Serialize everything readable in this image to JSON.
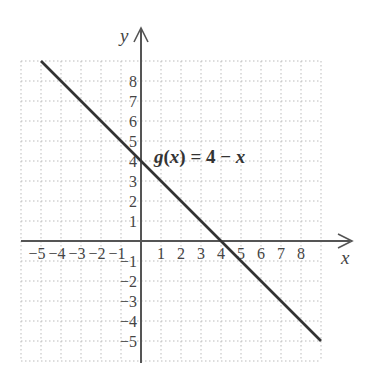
{
  "chart_data": {
    "type": "line",
    "title": "",
    "xlabel": "x",
    "ylabel": "y",
    "xlim": [
      -6,
      9
    ],
    "ylim": [
      -6,
      9
    ],
    "grid": true,
    "grid_style": "dotted",
    "x_ticks": [
      "−5",
      "−4",
      "−3",
      "−2",
      "−1",
      "1",
      "2",
      "3",
      "4",
      "5",
      "6",
      "7",
      "8"
    ],
    "y_ticks": [
      "8",
      "7",
      "6",
      "5",
      "4",
      "3",
      "2",
      "1",
      "−1",
      "−2",
      "−3",
      "−4",
      "−5"
    ],
    "series": [
      {
        "name": "g(x) = 4 − x",
        "equation": "g(x) = 4 − x",
        "x": [
          -5,
          9
        ],
        "y": [
          9,
          -5
        ]
      }
    ],
    "annotations": [
      {
        "text": "g(x) = 4 − x",
        "x": 0.7,
        "y": 4.8
      }
    ]
  },
  "labels": {
    "x_axis": "x",
    "y_axis": "y",
    "equation_g": "g",
    "equation_open": "(",
    "equation_x": "x",
    "equation_close": ") = 4 − ",
    "equation_x2": "x"
  },
  "colors": {
    "axis": "#555555",
    "line": "#333333",
    "grid": "#bbbbbb"
  }
}
